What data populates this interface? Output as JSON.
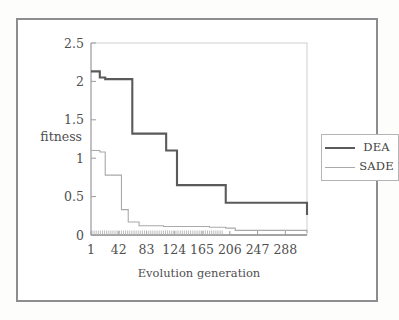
{
  "figure": {
    "caption": "",
    "background": "#ffffff",
    "border_color": "#8d8d90"
  },
  "legend": {
    "position": "right-outside",
    "entries": [
      {
        "label": "DEA",
        "style": "thick",
        "color": "#5a5a5c"
      },
      {
        "label": "SADE",
        "style": "thin",
        "color": "#a9a9ac"
      }
    ]
  },
  "chart_data": {
    "type": "line",
    "title": "",
    "subtitle": "",
    "xlabel": "Evolution  generation",
    "ylabel": "fitness",
    "xlim": [
      1,
      320
    ],
    "ylim": [
      0,
      2.5
    ],
    "grid": false,
    "legend_position": "right",
    "xticks": [
      1,
      42,
      83,
      124,
      165,
      206,
      247,
      288
    ],
    "xtick_labels": [
      "1",
      "42",
      "83",
      "124",
      "165",
      "206",
      "247",
      "288"
    ],
    "yticks": [
      0,
      0.5,
      1,
      1.5,
      2,
      2.5
    ],
    "ytick_labels": [
      "0",
      "0.5",
      "1",
      "1.5",
      "2",
      "2.5"
    ],
    "step_style": "post",
    "series": [
      {
        "name": "DEA",
        "color": "#5a5a5c",
        "linewidth": 2.1,
        "x": [
          1,
          6,
          14,
          22,
          46,
          62,
          99,
          112,
          128,
          200,
          212,
          320
        ],
        "values": [
          2.13,
          2.13,
          2.05,
          2.03,
          2.03,
          1.32,
          1.32,
          1.1,
          0.65,
          0.42,
          0.42,
          0.26
        ]
      },
      {
        "name": "SADE",
        "color": "#a9a9ac",
        "linewidth": 1.1,
        "x": [
          1,
          4,
          14,
          22,
          36,
          46,
          56,
          72,
          108,
          176,
          200,
          214,
          320
        ],
        "values": [
          1.1,
          1.1,
          1.08,
          0.78,
          0.78,
          0.33,
          0.17,
          0.12,
          0.11,
          0.1,
          0.09,
          0.06,
          0.03
        ]
      }
    ]
  }
}
